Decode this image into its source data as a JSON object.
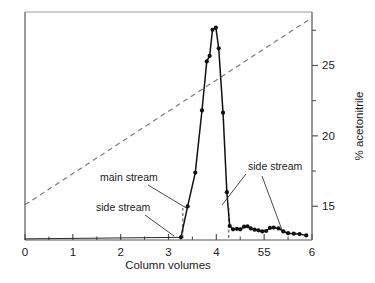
{
  "chart_data": {
    "type": "line",
    "title": "",
    "xlabel": "Column volumes",
    "ylabel": "% acetonitrile",
    "xlim": [
      0,
      6
    ],
    "ylim_right": [
      12.6,
      28.8
    ],
    "grid": false,
    "legend_position": "none",
    "x_ticks_major": [
      0,
      1,
      2,
      3,
      4,
      5,
      6
    ],
    "x_tick_labels": [
      "0",
      "1",
      "2",
      "3",
      "4",
      "55",
      "6"
    ],
    "x_ticks_minor": [
      0.5,
      1.5,
      2.5,
      3.5,
      4.5,
      5.5
    ],
    "y_ticks_right_major": [
      15,
      20,
      25
    ],
    "y_tick_right_labels": [
      "15",
      "20",
      "25"
    ],
    "y_ticks_right_minor": [
      17.5,
      22.5,
      27.5
    ],
    "series": [
      {
        "name": "UV absorbance (chromatogram)",
        "style": "solid-with-markers",
        "color": "#111111",
        "points": [
          [
            3.26,
            0.3
          ],
          [
            3.4,
            14.5
          ],
          [
            3.56,
            30.0
          ],
          [
            3.7,
            58.5
          ],
          [
            3.8,
            81.0
          ],
          [
            3.86,
            83.5
          ],
          [
            3.92,
            95.5
          ],
          [
            3.99,
            96.5
          ],
          [
            4.05,
            87.0
          ],
          [
            4.14,
            57.5
          ],
          [
            4.22,
            21.0
          ],
          [
            4.28,
            5.5
          ],
          [
            4.35,
            4.0
          ],
          [
            4.43,
            4.2
          ],
          [
            4.5,
            4.0
          ],
          [
            4.58,
            5.2
          ],
          [
            4.65,
            5.4
          ],
          [
            4.72,
            4.4
          ],
          [
            4.8,
            3.8
          ],
          [
            4.88,
            3.5
          ],
          [
            4.96,
            3.0
          ],
          [
            5.04,
            3.2
          ],
          [
            5.12,
            4.6
          ],
          [
            5.2,
            4.8
          ],
          [
            5.3,
            4.4
          ],
          [
            5.4,
            3.0
          ],
          [
            5.5,
            2.2
          ],
          [
            5.62,
            2.0
          ],
          [
            5.74,
            1.8
          ],
          [
            5.88,
            1.2
          ]
        ]
      },
      {
        "name": "acetonitrile gradient",
        "style": "dashed",
        "color": "#7a7a7a",
        "points": [
          [
            0.0,
            15.1
          ],
          [
            6.0,
            28.4
          ]
        ]
      }
    ],
    "drop_lines": [
      {
        "x": 3.3,
        "style": "dashed"
      },
      {
        "x": 4.26,
        "style": "dashed"
      }
    ],
    "annotations": [
      {
        "id": "main-stream",
        "text": "main stream",
        "text_x": 100,
        "text_y": 181,
        "leader": [
          [
            148,
            185
          ],
          [
            188,
            209
          ]
        ]
      },
      {
        "id": "side-stream-left",
        "text": "side stream",
        "text_x": 96,
        "text_y": 211,
        "leader": [
          [
            145,
            215
          ],
          [
            174,
            236
          ]
        ]
      },
      {
        "id": "side-stream-right",
        "text": "side stream",
        "text_x": 248,
        "text_y": 170,
        "leader_a": [
          [
            246,
            174
          ],
          [
            222,
            205
          ]
        ],
        "leader_b": [
          [
            262,
            176
          ],
          [
            282,
            230
          ]
        ]
      }
    ]
  },
  "axes": {
    "x_axis_name": "Column volumes",
    "y_axis_right_name": "% acetonitrile"
  }
}
